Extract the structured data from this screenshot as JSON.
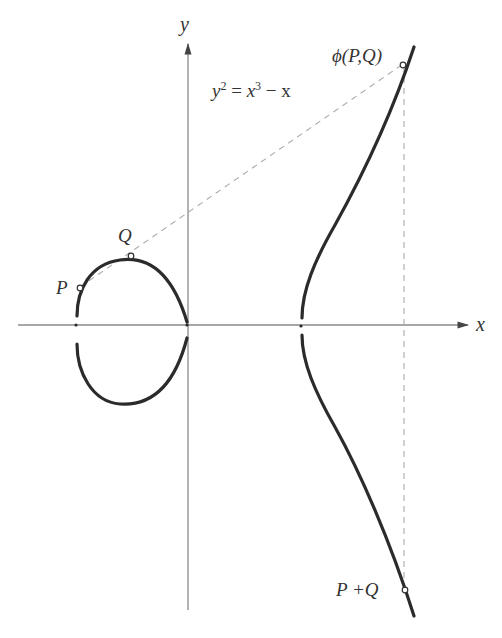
{
  "diagram": {
    "equation": {
      "lhs": "y",
      "lhs_exp": "2",
      "rhs_a": "x",
      "rhs_exp": "3",
      "rhs_b": " − x"
    },
    "axes": {
      "x_label": "x",
      "y_label": "y"
    },
    "points": {
      "P": "P",
      "Q": "Q",
      "phi": "ϕ(P,Q)",
      "sum": "P +Q"
    },
    "colors": {
      "curve": "#2b2b2b",
      "axis": "#8a8a8a",
      "dashed": "#aaaaaa",
      "text": "#333333"
    }
  }
}
